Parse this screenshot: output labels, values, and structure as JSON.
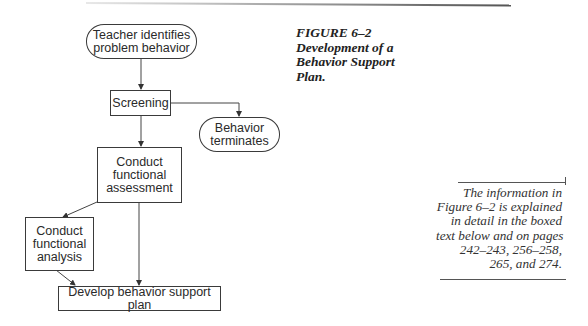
{
  "figure": {
    "caption_lines": [
      "FIGURE 6–2",
      "Development of a",
      "Behavior Support",
      "Plan."
    ]
  },
  "flowchart": {
    "nodes": {
      "teacher": {
        "lines": [
          "Teacher identifies",
          "problem behavior"
        ],
        "shape": "rounded"
      },
      "screening": {
        "lines": [
          "Screening"
        ],
        "shape": "rect"
      },
      "terminates": {
        "lines": [
          "Behavior",
          "terminates"
        ],
        "shape": "rounded"
      },
      "assessment": {
        "lines": [
          "Conduct",
          "functional",
          "assessment"
        ],
        "shape": "rect"
      },
      "analysis": {
        "lines": [
          "Conduct",
          "functional",
          "analysis"
        ],
        "shape": "rect"
      },
      "plan": {
        "lines": [
          "Develop behavior support plan"
        ],
        "shape": "rect"
      }
    },
    "edges": [
      {
        "from": "teacher",
        "to": "screening"
      },
      {
        "from": "screening",
        "to": "terminates"
      },
      {
        "from": "screening",
        "to": "assessment"
      },
      {
        "from": "assessment",
        "to": "analysis"
      },
      {
        "from": "assessment",
        "to": "plan"
      },
      {
        "from": "analysis",
        "to": "plan"
      }
    ]
  },
  "side_note": {
    "lines": [
      "The information in",
      "Figure 6–2 is explained",
      "in detail in the boxed",
      "text below and on pages",
      "242–243, 256–258,",
      "265, and 274."
    ]
  }
}
